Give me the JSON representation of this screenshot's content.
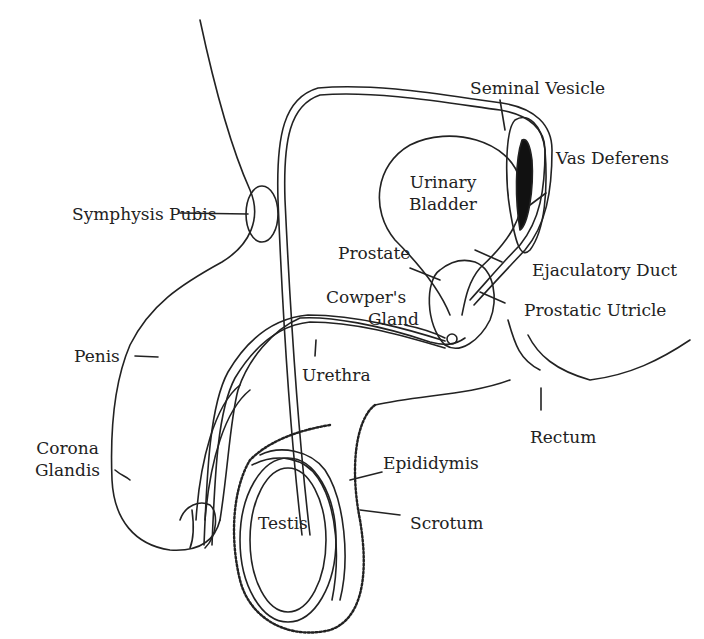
{
  "labels": {
    "seminal_vesicle": "Seminal Vesicle",
    "vas_deferens": "Vas Deferens",
    "urinary_bladder_1": "Urinary",
    "urinary_bladder_2": "Bladder",
    "symphysis_pubis": "Symphysis Pubis",
    "prostate": "Prostate",
    "ejaculatory_duct": "Ejaculatory Duct",
    "cowpers_gland_1": "Cowper's",
    "cowpers_gland_2": "Gland",
    "prostatic_utricle": "Prostatic Utricle",
    "penis": "Penis",
    "urethra": "Urethra",
    "rectum": "Rectum",
    "corona_glandis_1": "Corona",
    "corona_glandis_2": "Glandis",
    "epididymis": "Epididymis",
    "testis": "Testis",
    "scrotum": "Scrotum"
  }
}
